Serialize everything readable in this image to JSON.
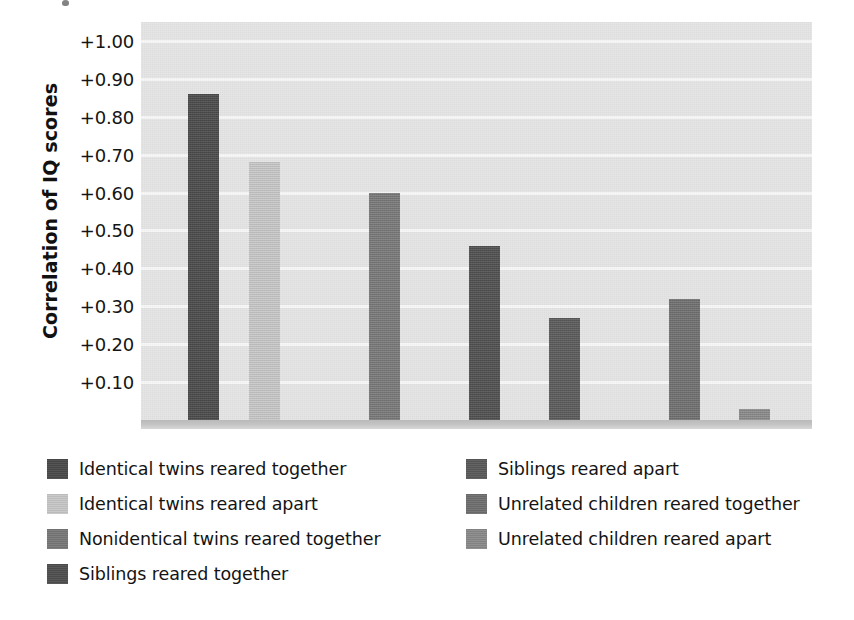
{
  "chart_data": {
    "type": "bar",
    "title": "",
    "xlabel": "",
    "ylabel": "Correlation of IQ scores",
    "ylim": [
      0,
      1.05
    ],
    "grid": true,
    "legend_position": "bottom",
    "y_tick_labels": [
      "+1.00",
      "+0.90",
      "+0.80",
      "+0.70",
      "+0.60",
      "+0.50",
      "+0.40",
      "+0.30",
      "+0.20",
      "+0.10"
    ],
    "y_tick_values": [
      1.0,
      0.9,
      0.8,
      0.7,
      0.6,
      0.5,
      0.4,
      0.3,
      0.2,
      0.1
    ],
    "categories": [
      "Identical twins reared together",
      "Identical twins reared apart",
      "Nonidentical twins reared together",
      "Siblings reared together",
      "Siblings reared apart",
      "Unrelated children reared together",
      "Unrelated children reared apart"
    ],
    "values": [
      0.86,
      0.68,
      0.6,
      0.46,
      0.27,
      0.32,
      0.03
    ],
    "colors": [
      "#4a4a4a",
      "#c7c7c7",
      "#787878",
      "#4f4f4f",
      "#5a5a5a",
      "#6f6f6f",
      "#8a8a8a"
    ],
    "bar_x_px": [
      188,
      249,
      369,
      469,
      549,
      669,
      739
    ],
    "bar_width_px": 31
  },
  "axis": {
    "y_title": "Correlation of IQ scores"
  },
  "legend": {
    "left_column": [
      {
        "label": "Identical twins reared together",
        "color": "#4a4a4a"
      },
      {
        "label": "Identical twins reared apart",
        "color": "#c7c7c7"
      },
      {
        "label": "Nonidentical twins reared together",
        "color": "#787878"
      },
      {
        "label": "Siblings reared together",
        "color": "#4f4f4f"
      }
    ],
    "right_column": [
      {
        "label": "Siblings reared apart",
        "color": "#5a5a5a"
      },
      {
        "label": "Unrelated children reared together",
        "color": "#6f6f6f"
      },
      {
        "label": "Unrelated children reared apart",
        "color": "#8a8a8a"
      }
    ]
  },
  "palette": {
    "plot_background": "#e4e4e4",
    "gridline": "#f7f7f7",
    "baseline": "#c6c6c6",
    "text": "#141414"
  }
}
